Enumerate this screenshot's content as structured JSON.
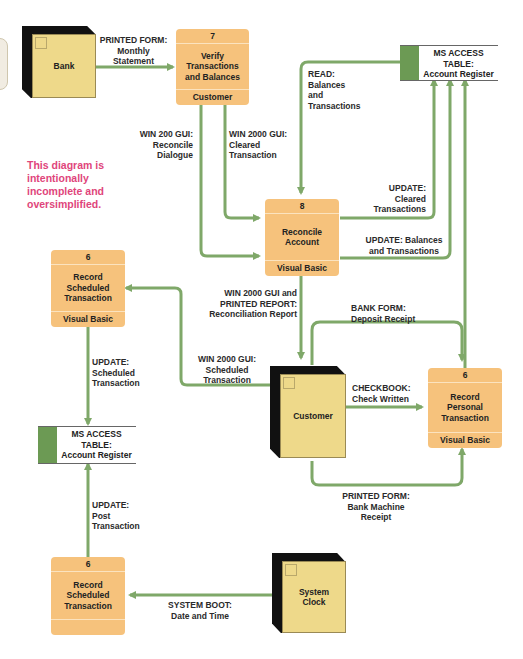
{
  "diagram": {
    "type": "data flow diagram",
    "note": "This diagram is\nintentionally\nincomplete and\noversimplified.",
    "colors": {
      "process_fill": "#f6c27c",
      "entity_face": "#eed98a",
      "entity_shadow": "#111111",
      "flow_line": "#7fa869",
      "store_id": "#6c9a54",
      "note_text": "#e0457b"
    },
    "entities": {
      "bank": "Bank",
      "customer": "Customer",
      "system_clock": "System\nClock"
    },
    "processes": {
      "verify": {
        "id": "7",
        "name": "Verify\nTransactions\nand Balances",
        "location": "Customer"
      },
      "reconcile": {
        "id": "8",
        "name": "Reconcile\nAccount",
        "location": "Visual Basic"
      },
      "record_scheduled_top": {
        "id": "6",
        "name": "Record\nScheduled\nTransaction",
        "location": "Visual Basic"
      },
      "record_personal": {
        "id": "6",
        "name": "Record\nPersonal\nTransaction",
        "location": "Visual Basic"
      },
      "record_scheduled_bottom": {
        "id": "6",
        "name": "Record\nScheduled\nTransaction",
        "location": ""
      }
    },
    "stores": {
      "top_right": "MS ACCESS\nTABLE:\nAccount Register",
      "left": "MS ACCESS\nTABLE:\nAccount Register"
    },
    "flows": {
      "bank_to_verify": "PRINTED FORM:\nMonthly\nStatement",
      "reconcile_dialogue": "WIN 200 GUI:\nReconcile\nDialogue",
      "cleared_transaction": "WIN 2000 GUI:\nCleared\nTransaction",
      "read_balances": "READ:\nBalances\nand\nTransactions",
      "update_cleared": "UPDATE:\nCleared\nTransactions",
      "update_balances": "UPDATE: Balances\nand Transactions",
      "reconciliation_report": "WIN 2000 GUI and\nPRINTED REPORT:\nReconciliation Report",
      "deposit_receipt": "BANK FORM:\nDeposit Receipt",
      "scheduled_transaction_gui": "WIN 2000 GUI:\nScheduled\nTransaction",
      "update_scheduled": "UPDATE:\nScheduled\nTransaction",
      "check_written": "CHECKBOOK:\nCheck Written",
      "bank_machine_receipt": "PRINTED FORM:\nBank Machine\nReceipt",
      "update_post": "UPDATE:\nPost\nTransaction",
      "system_boot": "SYSTEM BOOT:\nDate and Time"
    }
  }
}
